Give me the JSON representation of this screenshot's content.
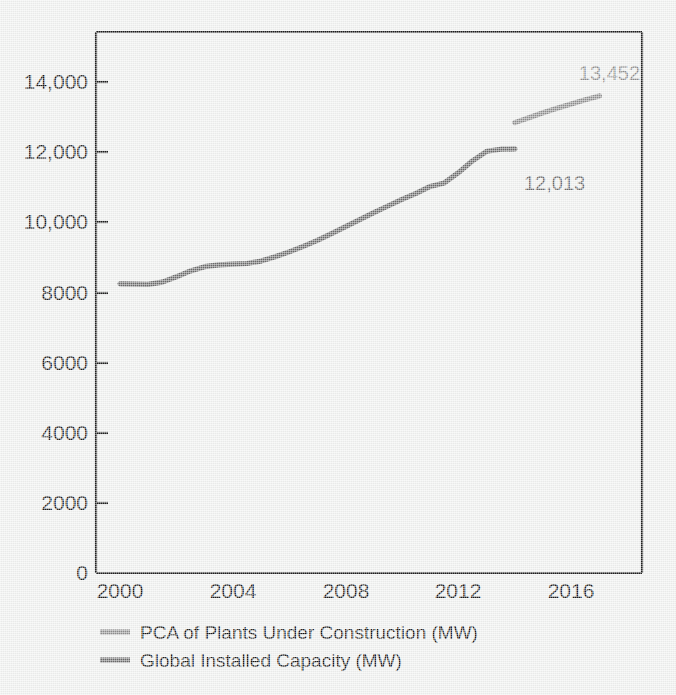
{
  "chart_data": {
    "type": "line",
    "title": "",
    "subtitle": "",
    "xlabel": "",
    "ylabel": "",
    "xlim": [
      2000,
      2017.5
    ],
    "ylim": [
      0,
      15000
    ],
    "grid": false,
    "legend_position": "bottom-left",
    "x_ticks": [
      "2000",
      "2004",
      "2008",
      "2012",
      "2016"
    ],
    "x_tick_values": [
      2000,
      2004,
      2008,
      2012,
      2016
    ],
    "y_ticks": [
      "0",
      "2000",
      "4000",
      "6000",
      "8000",
      "10,000",
      "12,000",
      "14,000"
    ],
    "y_tick_values": [
      0,
      2000,
      4000,
      6000,
      8000,
      10000,
      12000,
      14000
    ],
    "series": [
      {
        "name": "PCA of Plants Under Construction (MW)",
        "color": "#8e8e8e",
        "x": [
          2014,
          2014.5,
          2015,
          2015.5,
          2016,
          2016.5,
          2017
        ],
        "values": [
          12850,
          12990,
          13130,
          13260,
          13380,
          13500,
          13610
        ]
      },
      {
        "name": "Global Installed Capacity (MW)",
        "color": "#6a6a6a",
        "x": [
          2000,
          2000.5,
          2001,
          2001.5,
          2002,
          2002.5,
          2003,
          2003.5,
          2004,
          2004.5,
          2005,
          2005.5,
          2006,
          2006.5,
          2007,
          2007.5,
          2008,
          2008.5,
          2009,
          2009.5,
          2010,
          2010.5,
          2011,
          2011.5,
          2012,
          2012.5,
          2013,
          2013.5,
          2014
        ],
        "values": [
          8250,
          8240,
          8235,
          8300,
          8450,
          8620,
          8740,
          8790,
          8810,
          8830,
          8900,
          9020,
          9160,
          9320,
          9490,
          9680,
          9880,
          10080,
          10280,
          10470,
          10660,
          10830,
          11030,
          11130,
          11420,
          11760,
          12030,
          12090,
          12100
        ]
      }
    ],
    "annotations": [
      {
        "text": "13,452",
        "series": "PCA of Plants Under Construction (MW)",
        "color": "#8e8e8e",
        "x": 2017.1,
        "y": 14300
      },
      {
        "text": "12,013",
        "series": "Global Installed Capacity (MW)",
        "color": "#6a6a6a",
        "x": 2014.4,
        "y": 11200
      }
    ]
  },
  "legend": {
    "items": [
      {
        "label": "PCA of Plants Under Construction (MW)",
        "color": "#8e8e8e"
      },
      {
        "label": "Global Installed Capacity (MW)",
        "color": "#6a6a6a"
      }
    ]
  },
  "axes": {
    "y_labels": [
      "14,000",
      "12,000",
      "10,000",
      "8000",
      "6000",
      "4000",
      "2000",
      "0"
    ],
    "x_labels": [
      "2000",
      "2004",
      "2008",
      "2012",
      "2016"
    ]
  },
  "colors": {
    "background": "#eff0ef",
    "axis": "#1d1d1d",
    "series_light": "#8e8e8e",
    "series_dark": "#6a6a6a",
    "text": "#1a1a1a"
  }
}
